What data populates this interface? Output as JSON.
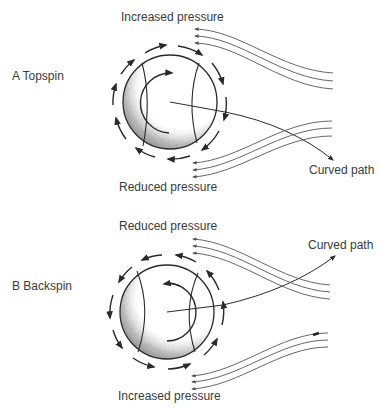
{
  "diagrams": [
    {
      "label": "A  Topspin",
      "top_label": "Increased pressure",
      "bottom_label": "Reduced pressure",
      "path_label": "Curved path",
      "spin": "topspin"
    },
    {
      "label": "B  Backspin",
      "top_label": "Reduced pressure",
      "bottom_label": "Increased pressure",
      "path_label": "Curved path",
      "spin": "backspin"
    }
  ],
  "colors": {
    "ink": "#2a2a2a",
    "streamline": "#555555",
    "shade": "#888888"
  }
}
